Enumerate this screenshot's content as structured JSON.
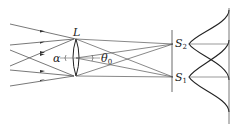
{
  "diagram": {
    "type": "optics-resolution",
    "labels": {
      "lens": "L",
      "alpha": "α",
      "theta": "θ",
      "theta_sub": "0",
      "s2": "S",
      "s2_sub": "2",
      "s1": "S",
      "s1_sub": "1"
    },
    "colors": {
      "line": "#444444",
      "curve": "#222222",
      "background": "#ffffff"
    }
  }
}
